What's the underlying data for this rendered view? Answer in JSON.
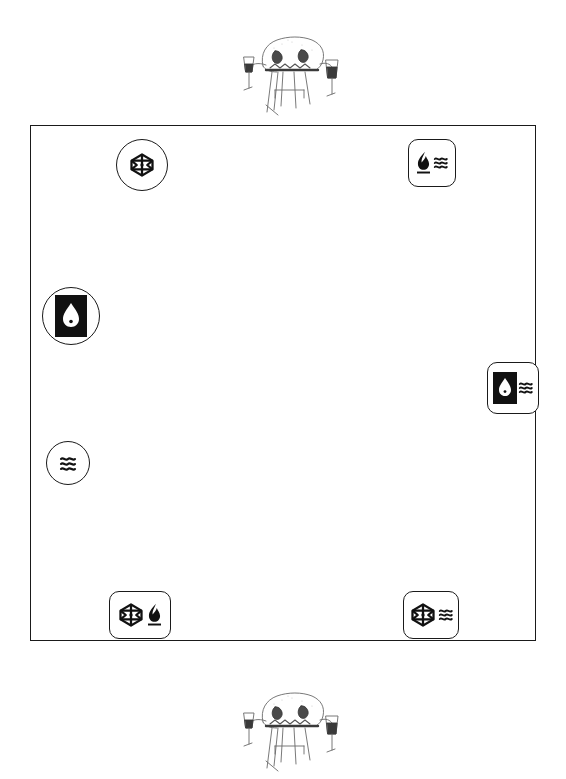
{
  "figure": {
    "background_color": "#ffffff",
    "line_color": "#1a1a1a"
  },
  "room": {
    "label": "room-boundary",
    "shape": "rectangle",
    "border_color": "#1a1a1a"
  },
  "sketches": [
    {
      "id": "sketch-top",
      "label": "hand-drawn table with wine glasses",
      "position": "above room"
    },
    {
      "id": "sketch-bottom",
      "label": "hand-drawn table with wine glasses",
      "position": "below room"
    }
  ],
  "markers": [
    {
      "id": "marker-cube-top",
      "shape": "circle",
      "icons": [
        "cube-icon"
      ],
      "label": "Gas / cube connection",
      "edge": "top"
    },
    {
      "id": "marker-flame-top",
      "shape": "rounded-square",
      "icons": [
        "flame-icon",
        "waves-icon"
      ],
      "label": "Heat and ventilation point",
      "edge": "top-right"
    },
    {
      "id": "marker-water-left",
      "shape": "circle",
      "icons": [
        "water-drop-inverted-icon"
      ],
      "label": "Water supply point",
      "edge": "left"
    },
    {
      "id": "marker-water-right",
      "shape": "rounded-square",
      "icons": [
        "water-drop-inverted-icon",
        "waves-icon"
      ],
      "label": "Water and ventilation point",
      "edge": "right"
    },
    {
      "id": "marker-waves-left",
      "shape": "circle",
      "icons": [
        "waves-icon"
      ],
      "label": "Ventilation point",
      "edge": "left"
    },
    {
      "id": "marker-cube-flame",
      "shape": "rounded-square",
      "icons": [
        "cube-icon",
        "flame-icon"
      ],
      "label": "Gas and heat point",
      "edge": "bottom-left"
    },
    {
      "id": "marker-cube-waves",
      "shape": "rounded-square",
      "icons": [
        "cube-icon",
        "waves-icon"
      ],
      "label": "Gas and ventilation point",
      "edge": "bottom-right"
    }
  ],
  "icon_glyphs": {
    "cube-icon": "hexagonal cube outline",
    "flame-icon": "solid flame above bar",
    "waves-icon": "three wavy lines",
    "water-drop-inverted-icon": "white droplet on black square"
  }
}
